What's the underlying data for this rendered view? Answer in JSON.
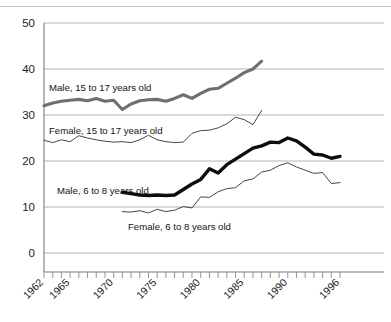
{
  "chart_data": {
    "type": "line",
    "title": "",
    "subtitle": "",
    "xlabel": "",
    "ylabel": "",
    "xlim": [
      1962,
      1996
    ],
    "ylim": [
      0,
      50
    ],
    "yticks": [
      0,
      10,
      20,
      30,
      40,
      50
    ],
    "xticks_labeled": [
      1962,
      1965,
      1970,
      1975,
      1980,
      1985,
      1990,
      1996
    ],
    "xtick_minor_every": 1,
    "grid": "horizontal",
    "legend_position": "inline-annotations",
    "series": [
      {
        "name": "Male, 15 to 17 years old",
        "style": "thick-gray",
        "color": "#6f6f6f",
        "x": [
          1962,
          1963,
          1964,
          1965,
          1966,
          1967,
          1968,
          1969,
          1970,
          1971,
          1972,
          1973,
          1974,
          1975,
          1976,
          1977,
          1978,
          1979,
          1980,
          1981,
          1982,
          1983,
          1984,
          1985,
          1986,
          1987
        ],
        "values": [
          32.0,
          32.6,
          33.0,
          33.2,
          33.4,
          33.1,
          33.6,
          33.0,
          33.2,
          31.2,
          32.4,
          33.1,
          33.3,
          33.4,
          33.0,
          33.6,
          34.4,
          33.6,
          34.7,
          35.6,
          35.8,
          36.9,
          38.0,
          39.2,
          40.0,
          41.7
        ]
      },
      {
        "name": "Female, 15 to 17 years old",
        "style": "thin-black",
        "color": "#3b3b3b",
        "x": [
          1962,
          1963,
          1964,
          1965,
          1966,
          1967,
          1968,
          1969,
          1970,
          1971,
          1972,
          1973,
          1974,
          1975,
          1976,
          1977,
          1978,
          1979,
          1980,
          1981,
          1982,
          1983,
          1984,
          1985,
          1986,
          1987
        ],
        "values": [
          24.5,
          24.0,
          24.6,
          24.2,
          25.5,
          25.0,
          24.6,
          24.3,
          24.1,
          24.2,
          24.0,
          24.6,
          25.6,
          24.6,
          24.2,
          24.0,
          24.1,
          26.0,
          26.6,
          26.7,
          27.2,
          28.1,
          29.5,
          29.0,
          27.9,
          31.0
        ]
      },
      {
        "name": "Male, 6 to 8 years old",
        "style": "thick-black",
        "color": "#0d0d0d",
        "x": [
          1971,
          1972,
          1973,
          1974,
          1975,
          1976,
          1977,
          1978,
          1979,
          1980,
          1981,
          1982,
          1983,
          1984,
          1985,
          1986,
          1987,
          1988,
          1989,
          1990,
          1991,
          1992,
          1993,
          1994,
          1995,
          1996
        ],
        "values": [
          13.2,
          12.9,
          12.6,
          12.5,
          12.6,
          12.5,
          12.6,
          13.8,
          15.0,
          16.0,
          18.3,
          17.4,
          19.2,
          20.4,
          21.6,
          22.8,
          23.3,
          24.1,
          24.0,
          25.0,
          24.4,
          23.0,
          21.5,
          21.3,
          20.6,
          21.0
        ]
      },
      {
        "name": "Female, 6 to 8 years old",
        "style": "thin-black",
        "color": "#3b3b3b",
        "x": [
          1971,
          1972,
          1973,
          1974,
          1975,
          1976,
          1977,
          1978,
          1979,
          1980,
          1981,
          1982,
          1983,
          1984,
          1985,
          1986,
          1987,
          1988,
          1989,
          1990,
          1991,
          1992,
          1993,
          1994,
          1995,
          1996
        ],
        "values": [
          9.0,
          8.9,
          9.2,
          8.7,
          9.5,
          9.0,
          9.3,
          10.1,
          9.8,
          12.2,
          12.1,
          13.3,
          14.0,
          14.2,
          15.7,
          16.1,
          17.6,
          18.0,
          19.0,
          19.6,
          18.7,
          18.0,
          17.3,
          17.5,
          15.1,
          15.3
        ]
      }
    ],
    "annotations": [
      {
        "name": "label-male-teen",
        "text": "Male, 15 to 17 years old",
        "x_px": 49,
        "y_px": 91
      },
      {
        "name": "label-female-teen",
        "text": "Female, 15 to 17 years old",
        "x_px": 49,
        "y_px": 134
      },
      {
        "name": "label-male-child",
        "text": "Male, 6 to 8 years old",
        "x_px": 57,
        "y_px": 194
      },
      {
        "name": "label-female-child",
        "text": "Female, 6 to 8 years old",
        "x_px": 128,
        "y_px": 230
      }
    ]
  }
}
